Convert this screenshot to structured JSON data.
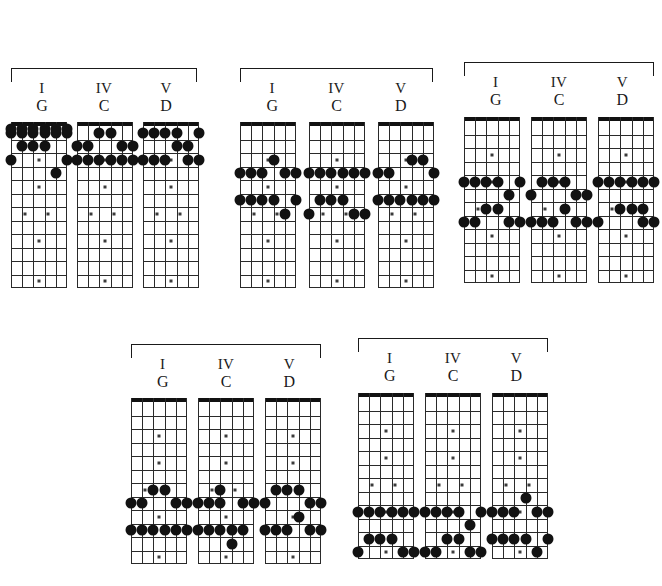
{
  "page": {
    "background_color": "#ffffff",
    "ink_color": "#121212"
  },
  "legend": {
    "roman_numerals": [
      "I",
      "IV",
      "V"
    ],
    "chord_names": [
      "G",
      "C",
      "D"
    ]
  },
  "fretboard": {
    "strings": 6,
    "frets": 12,
    "inlay_frets_single": [
      3,
      5,
      9
    ],
    "inlay_frets_double": [
      7
    ],
    "inlay_fret_octave": [
      12
    ],
    "nut_label": "nut"
  },
  "chart_data": {
    "type": "table",
    "sets": [
      {
        "set_index": 1,
        "position": "top-left",
        "bracket": true,
        "boards": [
          {
            "roman": "I",
            "chord": "G",
            "notes": [
              {
                "string": 1,
                "fret": 2
              },
              {
                "string": 2,
                "fret": 2
              },
              {
                "string": 3,
                "fret": 2
              },
              {
                "string": 4,
                "fret": 0
              },
              {
                "string": 5,
                "fret": 3
              },
              {
                "string": 6,
                "fret": 0
              },
              {
                "string": 1,
                "fret": 0
              },
              {
                "string": 2,
                "fret": 0
              },
              {
                "string": 3,
                "fret": 0
              },
              {
                "string": 4,
                "fret": 0
              },
              {
                "string": 5,
                "fret": 0
              },
              {
                "string": 6,
                "fret": 0
              }
            ]
          },
          {
            "roman": "IV",
            "chord": "C",
            "notes": [
              {
                "string": 3,
                "fret": 2
              },
              {
                "string": 4,
                "fret": 2
              },
              {
                "string": 1,
                "fret": 0
              },
              {
                "string": 2,
                "fret": 0
              },
              {
                "string": 3,
                "fret": 0
              },
              {
                "string": 5,
                "fret": 0
              },
              {
                "string": 6,
                "fret": 0
              }
            ]
          },
          {
            "roman": "V",
            "chord": "D",
            "notes": [
              {
                "string": 1,
                "fret": 2
              },
              {
                "string": 2,
                "fret": 2
              },
              {
                "string": 3,
                "fret": 2
              },
              {
                "string": 4,
                "fret": 2
              },
              {
                "string": 6,
                "fret": 2
              },
              {
                "string": 4,
                "fret": 4
              },
              {
                "string": 5,
                "fret": 4
              },
              {
                "string": 1,
                "fret": 0
              },
              {
                "string": 2,
                "fret": 0
              },
              {
                "string": 5,
                "fret": 0
              },
              {
                "string": 6,
                "fret": 0
              }
            ]
          }
        ]
      },
      {
        "set_index": 2,
        "position": "top-middle",
        "bracket": true,
        "boards": [
          {
            "roman": "I",
            "chord": "G",
            "notes": []
          },
          {
            "roman": "IV",
            "chord": "C",
            "notes": []
          },
          {
            "roman": "V",
            "chord": "D",
            "notes": []
          }
        ]
      },
      {
        "set_index": 3,
        "position": "top-right",
        "bracket": true,
        "boards": [
          {
            "roman": "I",
            "chord": "G",
            "notes": []
          },
          {
            "roman": "IV",
            "chord": "C",
            "notes": []
          },
          {
            "roman": "V",
            "chord": "D",
            "notes": []
          }
        ]
      },
      {
        "set_index": 4,
        "position": "bottom-left",
        "bracket": true,
        "boards": [
          {
            "roman": "I",
            "chord": "G",
            "notes": []
          },
          {
            "roman": "IV",
            "chord": "C",
            "notes": []
          },
          {
            "roman": "V",
            "chord": "D",
            "notes": []
          }
        ]
      },
      {
        "set_index": 5,
        "position": "bottom-right",
        "bracket": true,
        "boards": [
          {
            "roman": "I",
            "chord": "G",
            "notes": []
          },
          {
            "roman": "IV",
            "chord": "C",
            "notes": []
          },
          {
            "roman": "V",
            "chord": "D",
            "notes": []
          }
        ]
      }
    ]
  },
  "geometry": {
    "sets": [
      {
        "left": 11,
        "bracket_top": 68,
        "bracket_width": 186,
        "labels_top": 80,
        "boards_top": 122,
        "board_gap": 10
      },
      {
        "left": 240,
        "bracket_top": 68,
        "bracket_width": 193,
        "labels_top": 80,
        "boards_top": 122,
        "board_gap": 13
      },
      {
        "left": 464,
        "bracket_top": 62,
        "bracket_width": 190,
        "labels_top": 74,
        "boards_top": 117,
        "board_gap": 11
      },
      {
        "left": 131,
        "bracket_top": 344,
        "bracket_width": 190,
        "labels_top": 356,
        "boards_top": 398,
        "board_gap": 11
      },
      {
        "left": 358,
        "bracket_top": 338,
        "bracket_width": 190,
        "labels_top": 350,
        "boards_top": 393,
        "board_gap": 11
      }
    ],
    "board": {
      "width": 56,
      "height": 166,
      "nut_height": 4
    }
  },
  "note_maps": {
    "set1_G": [
      [
        1,
        2
      ],
      [
        2,
        2
      ],
      [
        3,
        2
      ],
      [
        4,
        4
      ],
      [
        0,
        1
      ],
      [
        1,
        1
      ],
      [
        2,
        1
      ],
      [
        3,
        1
      ],
      [
        4,
        1
      ],
      [
        5,
        1
      ],
      [
        0,
        3
      ],
      [
        5,
        3
      ],
      [
        0,
        0
      ],
      [
        1,
        0
      ],
      [
        2,
        0
      ],
      [
        3,
        0
      ],
      [
        4,
        0
      ],
      [
        5,
        0
      ]
    ],
    "set1_C": [
      [
        2,
        1
      ],
      [
        3,
        1
      ],
      [
        0,
        2
      ],
      [
        1,
        2
      ],
      [
        4,
        2
      ],
      [
        5,
        2
      ],
      [
        0,
        3
      ],
      [
        1,
        3
      ],
      [
        2,
        3
      ],
      [
        3,
        3
      ],
      [
        4,
        3
      ],
      [
        5,
        3
      ]
    ],
    "set1_D": [
      [
        0,
        1
      ],
      [
        1,
        1
      ],
      [
        2,
        1
      ],
      [
        3,
        1
      ],
      [
        5,
        1
      ],
      [
        3,
        2
      ],
      [
        4,
        2
      ],
      [
        0,
        3
      ],
      [
        1,
        3
      ],
      [
        2,
        3
      ],
      [
        4,
        3
      ],
      [
        5,
        3
      ]
    ],
    "set2_G": [
      [
        0,
        4
      ],
      [
        1,
        4
      ],
      [
        2,
        4
      ],
      [
        4,
        4
      ],
      [
        5,
        4
      ],
      [
        3,
        3
      ],
      [
        0,
        6
      ],
      [
        1,
        6
      ],
      [
        2,
        6
      ],
      [
        3,
        6
      ],
      [
        5,
        6
      ],
      [
        4,
        7
      ]
    ],
    "set2_C": [
      [
        0,
        4
      ],
      [
        1,
        4
      ],
      [
        2,
        4
      ],
      [
        3,
        4
      ],
      [
        4,
        4
      ],
      [
        5,
        4
      ],
      [
        1,
        6
      ],
      [
        2,
        6
      ],
      [
        3,
        6
      ],
      [
        0,
        7
      ],
      [
        4,
        7
      ],
      [
        5,
        7
      ]
    ],
    "set2_D": [
      [
        3,
        3
      ],
      [
        4,
        3
      ],
      [
        0,
        4
      ],
      [
        1,
        4
      ],
      [
        5,
        4
      ],
      [
        0,
        6
      ],
      [
        1,
        6
      ],
      [
        2,
        6
      ],
      [
        3,
        6
      ],
      [
        4,
        6
      ],
      [
        5,
        6
      ]
    ],
    "set3_G": [
      [
        0,
        5
      ],
      [
        1,
        5
      ],
      [
        2,
        5
      ],
      [
        3,
        5
      ],
      [
        5,
        5
      ],
      [
        4,
        6
      ],
      [
        2,
        7
      ],
      [
        3,
        7
      ],
      [
        0,
        8
      ],
      [
        1,
        8
      ],
      [
        4,
        8
      ],
      [
        5,
        8
      ]
    ],
    "set3_C": [
      [
        1,
        5
      ],
      [
        2,
        5
      ],
      [
        3,
        5
      ],
      [
        0,
        6
      ],
      [
        4,
        6
      ],
      [
        5,
        6
      ],
      [
        3,
        7
      ],
      [
        0,
        8
      ],
      [
        1,
        8
      ],
      [
        2,
        8
      ],
      [
        4,
        8
      ],
      [
        5,
        8
      ]
    ],
    "set3_D": [
      [
        0,
        5
      ],
      [
        1,
        5
      ],
      [
        2,
        5
      ],
      [
        3,
        5
      ],
      [
        4,
        5
      ],
      [
        5,
        5
      ],
      [
        2,
        7
      ],
      [
        3,
        7
      ],
      [
        4,
        7
      ],
      [
        0,
        8
      ],
      [
        4,
        8
      ],
      [
        5,
        8
      ]
    ],
    "set4_G": [
      [
        2,
        7
      ],
      [
        3,
        7
      ],
      [
        0,
        8
      ],
      [
        1,
        8
      ],
      [
        4,
        8
      ],
      [
        5,
        8
      ],
      [
        0,
        10
      ],
      [
        1,
        10
      ],
      [
        2,
        10
      ],
      [
        3,
        10
      ],
      [
        4,
        10
      ],
      [
        5,
        10
      ]
    ],
    "set4_C": [
      [
        2,
        7
      ],
      [
        0,
        8
      ],
      [
        1,
        8
      ],
      [
        2,
        8
      ],
      [
        4,
        8
      ],
      [
        5,
        8
      ],
      [
        0,
        10
      ],
      [
        1,
        10
      ],
      [
        2,
        10
      ],
      [
        3,
        10
      ],
      [
        4,
        10
      ],
      [
        3,
        11
      ]
    ],
    "set4_D": [
      [
        1,
        7
      ],
      [
        2,
        7
      ],
      [
        3,
        7
      ],
      [
        0,
        8
      ],
      [
        4,
        8
      ],
      [
        5,
        8
      ],
      [
        3,
        9
      ],
      [
        0,
        10
      ],
      [
        1,
        10
      ],
      [
        2,
        10
      ],
      [
        4,
        10
      ],
      [
        5,
        10
      ]
    ],
    "set5_G": [
      [
        0,
        9
      ],
      [
        1,
        9
      ],
      [
        2,
        9
      ],
      [
        3,
        9
      ],
      [
        4,
        9
      ],
      [
        5,
        9
      ],
      [
        1,
        11
      ],
      [
        2,
        11
      ],
      [
        3,
        11
      ],
      [
        0,
        12
      ],
      [
        4,
        12
      ],
      [
        5,
        12
      ]
    ],
    "set5_C": [
      [
        0,
        9
      ],
      [
        1,
        9
      ],
      [
        2,
        9
      ],
      [
        3,
        9
      ],
      [
        5,
        9
      ],
      [
        4,
        10
      ],
      [
        2,
        11
      ],
      [
        3,
        11
      ],
      [
        0,
        12
      ],
      [
        1,
        12
      ],
      [
        4,
        12
      ],
      [
        5,
        12
      ]
    ],
    "set5_D": [
      [
        3,
        8
      ],
      [
        0,
        9
      ],
      [
        1,
        9
      ],
      [
        2,
        9
      ],
      [
        4,
        9
      ],
      [
        5,
        9
      ],
      [
        0,
        11
      ],
      [
        1,
        11
      ],
      [
        2,
        11
      ],
      [
        3,
        11
      ],
      [
        5,
        11
      ],
      [
        4,
        12
      ]
    ]
  }
}
